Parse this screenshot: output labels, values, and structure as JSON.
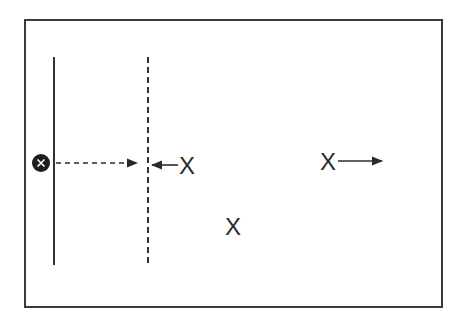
{
  "diagram": {
    "frame": {
      "color": "#3a3a3a"
    },
    "solid_line": {
      "x": 54,
      "y1": 57,
      "y2": 265,
      "style": "solid"
    },
    "dashed_line": {
      "x": 148,
      "y1": 57,
      "y2": 267,
      "style": "dashed"
    },
    "source_marker": {
      "icon": "filled-circle-x-icon",
      "glyph": "x",
      "cx": 41,
      "cy": 163,
      "r": 9
    },
    "arrows": [
      {
        "name": "dashed-arrow-right",
        "from": [
          54,
          163
        ],
        "to": [
          137,
          163
        ],
        "style": "dashed"
      },
      {
        "name": "arrow-left-to-dashed-line",
        "from": [
          178,
          165
        ],
        "to": [
          152,
          165
        ],
        "style": "solid"
      },
      {
        "name": "arrow-right-away",
        "from": [
          338,
          161
        ],
        "to": [
          382,
          161
        ],
        "style": "solid"
      }
    ],
    "labels": [
      {
        "text": "X",
        "position": "left-x-near-dashed-line"
      },
      {
        "text": "X",
        "position": "right-x-with-arrow"
      },
      {
        "text": "X",
        "position": "bottom-center-x"
      }
    ]
  }
}
